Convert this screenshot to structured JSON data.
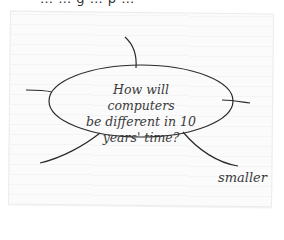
{
  "header_fragment": "… … g … p …",
  "diagram": {
    "type": "spider diagram",
    "center": {
      "lines": [
        "How will computers",
        "be different in 10",
        "years' time?"
      ]
    },
    "branches": [
      {
        "id": "top",
        "label": ""
      },
      {
        "id": "left",
        "label": ""
      },
      {
        "id": "right",
        "label": ""
      },
      {
        "id": "bottom-left",
        "label": ""
      },
      {
        "id": "bottom-right",
        "label": "smaller"
      }
    ]
  }
}
